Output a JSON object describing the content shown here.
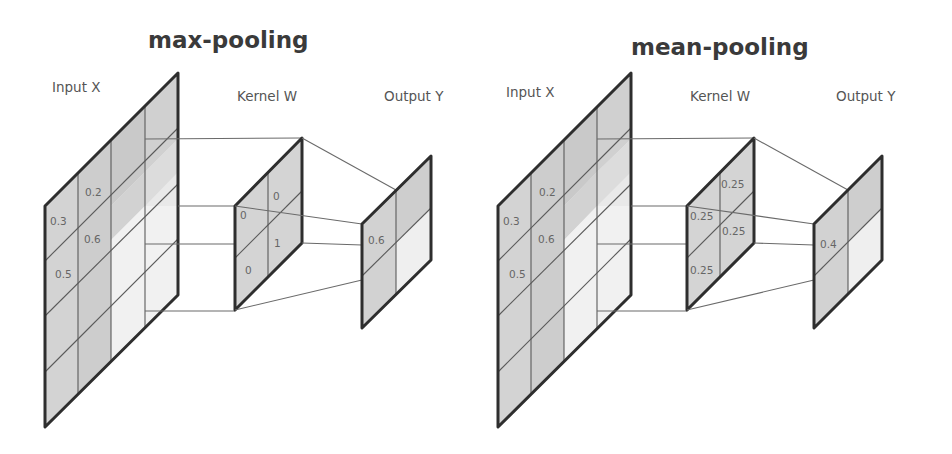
{
  "panels": [
    {
      "id": "max",
      "title": "max-pooling",
      "labels": {
        "input": "Input X",
        "kernel": "Kernel W",
        "output": "Output Y"
      },
      "input_values": [
        "0.2",
        "0.3",
        "0.6",
        "0.5"
      ],
      "kernel_values": [
        "0",
        "0",
        "1",
        "0"
      ],
      "output_values": [
        "0.6"
      ],
      "geometry": {
        "input": {
          "x": 45,
          "top": 206,
          "w": 133,
          "h": 221,
          "dy": 133,
          "cols": 4
        },
        "kernel": {
          "x": 235,
          "top": 206,
          "w": 67,
          "h": 104,
          "dy": 68,
          "cols": 2
        },
        "output": {
          "x": 362,
          "top": 224,
          "w": 69,
          "h": 104,
          "dy": 68,
          "cols": 2
        }
      }
    },
    {
      "id": "mean",
      "title": "mean-pooling",
      "labels": {
        "input": "Input X",
        "kernel": "Kernel W",
        "output": "Output Y"
      },
      "input_values": [
        "0.2",
        "0.3",
        "0.6",
        "0.5"
      ],
      "kernel_values": [
        "0.25",
        "0.25",
        "0.25",
        "0.25"
      ],
      "output_values": [
        "0.4"
      ],
      "geometry": {
        "input": {
          "x": 498,
          "top": 206,
          "w": 133,
          "h": 221,
          "dy": 133,
          "cols": 4
        },
        "kernel": {
          "x": 687,
          "top": 206,
          "w": 67,
          "h": 104,
          "dy": 68,
          "cols": 2
        },
        "output": {
          "x": 814,
          "top": 224,
          "w": 68,
          "h": 104,
          "dy": 68,
          "cols": 2
        }
      }
    }
  ],
  "colors": {
    "shade_dark": "#c4c4c4",
    "shade_mid": "#d6d6d6",
    "shade_light": "#ebebeb",
    "shade_lightest": "#f3f3f3",
    "outline": "#2e2e2e"
  }
}
